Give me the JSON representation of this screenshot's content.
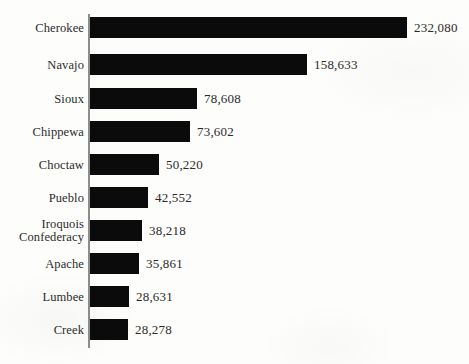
{
  "chart": {
    "type": "bar",
    "orientation": "horizontal",
    "background_color": "#fdfdfb",
    "bar_color": "#0b0b0b",
    "axis_color": "#8c8c8c",
    "text_color": "#2b2b2b",
    "title": "",
    "subtitle": "",
    "xlabel": "",
    "ylabel": "",
    "legend": "none",
    "grid": false
  },
  "chart_data": {
    "type": "bar",
    "title": "",
    "xlabel": "",
    "ylabel": "",
    "grid": false,
    "legend": "none",
    "xlim": [
      0,
      232080
    ],
    "categories": [
      "Cherokee",
      "Navajo",
      "Sioux",
      "Chippewa",
      "Choctaw",
      "Pueblo",
      "Iroquois\nConfederacy",
      "Apache",
      "Lumbee",
      "Creek"
    ],
    "values": [
      232080,
      158633,
      78608,
      73602,
      50220,
      42552,
      38218,
      35861,
      28631,
      28278
    ],
    "value_labels": [
      "232,080",
      "158,633",
      "78,608",
      "73,602",
      "50,220",
      "42,552",
      "38,218",
      "35,861",
      "28,631",
      "28,278"
    ]
  },
  "rows": [
    {
      "label": "Cherokee",
      "value": 232080,
      "value_label": "232,080",
      "top": 17,
      "bar_width": 317
    },
    {
      "label": "Navajo",
      "value": 158633,
      "value_label": "158,633",
      "top": 54,
      "bar_width": 217
    },
    {
      "label": "Sioux",
      "value": 78608,
      "value_label": "78,608",
      "top": 88,
      "bar_width": 107
    },
    {
      "label": "Chippewa",
      "value": 73602,
      "value_label": "73,602",
      "top": 121,
      "bar_width": 100
    },
    {
      "label": "Choctaw",
      "value": 50220,
      "value_label": "50,220",
      "top": 154,
      "bar_width": 69
    },
    {
      "label": "Pueblo",
      "value": 42552,
      "value_label": "42,552",
      "top": 187,
      "bar_width": 58
    },
    {
      "label": "Iroquois\nConfederacy",
      "value": 38218,
      "value_label": "38,218",
      "top": 220,
      "bar_width": 52
    },
    {
      "label": "Apache",
      "value": 35861,
      "value_label": "35,861",
      "top": 253,
      "bar_width": 49
    },
    {
      "label": "Lumbee",
      "value": 28631,
      "value_label": "28,631",
      "top": 286,
      "bar_width": 39
    },
    {
      "label": "Creek",
      "value": 28278,
      "value_label": "28,278",
      "top": 319,
      "bar_width": 38
    }
  ]
}
